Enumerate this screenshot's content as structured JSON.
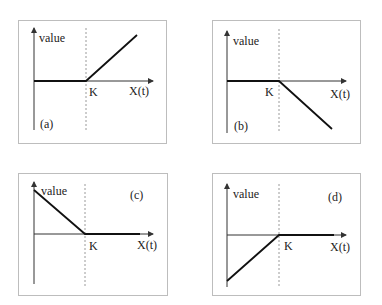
{
  "labels": {
    "y_axis": "value",
    "x_axis": "X(t)",
    "strike": "K"
  },
  "panels": [
    {
      "id": "a",
      "tag": "(a)",
      "description": "long call payoff: flat at zero until K, then rising"
    },
    {
      "id": "b",
      "tag": "(b)",
      "description": "short call payoff: flat at zero until K, then falling"
    },
    {
      "id": "c",
      "tag": "(c)",
      "description": "long put payoff: falling to zero at K, then flat"
    },
    {
      "id": "d",
      "tag": "(d)",
      "description": "short put payoff: rising from negative to zero at K, then flat"
    }
  ],
  "colors": {
    "frame": "#bdbdbd",
    "axis": "#333333",
    "strike_line": "#9a9a9a",
    "payoff": "#111111"
  }
}
